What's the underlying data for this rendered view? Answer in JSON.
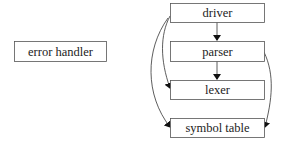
{
  "diagram": {
    "type": "dependency-graph",
    "nodes": [
      {
        "id": "error_handler",
        "label": "error handler"
      },
      {
        "id": "driver",
        "label": "driver"
      },
      {
        "id": "parser",
        "label": "parser"
      },
      {
        "id": "lexer",
        "label": "lexer"
      },
      {
        "id": "symbol_table",
        "label": "symbol table"
      }
    ],
    "edges": [
      {
        "from": "driver",
        "to": "parser"
      },
      {
        "from": "driver",
        "to": "lexer"
      },
      {
        "from": "driver",
        "to": "symbol_table"
      },
      {
        "from": "parser",
        "to": "lexer"
      },
      {
        "from": "parser",
        "to": "symbol_table"
      }
    ]
  }
}
